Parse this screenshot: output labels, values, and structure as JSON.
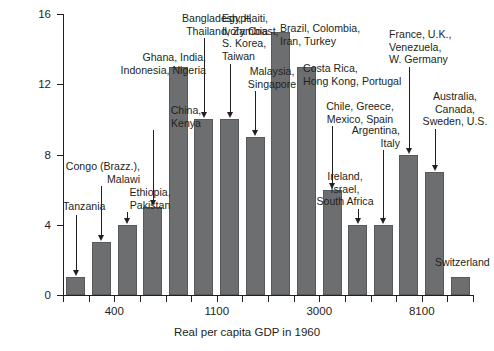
{
  "chart_data": {
    "type": "bar",
    "title": "",
    "subtitle": "",
    "xlabel": "Real per capita GDP in 1960",
    "ylabel": "Number of countries",
    "ylim": [
      0,
      16
    ],
    "yticks": [
      0,
      4,
      8,
      12,
      16
    ],
    "ytick_labels": [
      "0",
      "4",
      "8",
      "12",
      "16"
    ],
    "xtick_labels": [
      "400",
      "1100",
      "3000",
      "8100"
    ],
    "xtick_bins": [
      2,
      6,
      10,
      14
    ],
    "grid": false,
    "legend": "none",
    "bin_count": 16,
    "categories": [
      "1",
      "2",
      "3",
      "4",
      "5",
      "6",
      "7",
      "8",
      "9",
      "10",
      "11",
      "12",
      "13",
      "14",
      "15",
      "16"
    ],
    "values": [
      1,
      3,
      4,
      5,
      13,
      10,
      10,
      9,
      15,
      13,
      6,
      4,
      4,
      8,
      7,
      1
    ],
    "bar_color": "#6d6e70",
    "annotations": [
      {
        "text": "Tanzania",
        "bin": 1,
        "align": "center"
      },
      {
        "text": "Congo (Brazz.),\nMalawi",
        "bin": 2,
        "align": "right"
      },
      {
        "text": "Ethiopia,\nPakistan",
        "bin": 3,
        "align": "center"
      },
      {
        "text": "China,\nKenya",
        "bin": 4,
        "align": "center"
      },
      {
        "text": "Ghana, India,\nIndonesia, Nigeria",
        "bin": 5,
        "align": "right"
      },
      {
        "text": "Bangladesh, Haiti,\nThailand, Zambia",
        "bin": 6,
        "align": "right"
      },
      {
        "text": "Egypt,\nIvory Coast,\nS. Korea,\nTaiwan",
        "bin": 7,
        "align": "left"
      },
      {
        "text": "Malaysia,\nSingapore",
        "bin": 8,
        "align": "center"
      },
      {
        "text": "Brazil, Colombia,\nIran, Turkey",
        "bin": 9,
        "align": "left"
      },
      {
        "text": "Costa Rica,\nHong Kong, Portugal",
        "bin": 10,
        "align": "left"
      },
      {
        "text": "Chile, Greece,\nMexico, Spain",
        "bin": 11,
        "align": "center"
      },
      {
        "text": "Ireland,\nIsrael,\nSouth Africa",
        "bin": 12,
        "align": "center"
      },
      {
        "text": "Argentina,\nItaly",
        "bin": 13,
        "align": "right"
      },
      {
        "text": "France, U.K.,\nVenezuela,\nW. Germany",
        "bin": 14,
        "align": "left"
      },
      {
        "text": "Australia,\nCanada,\nSweden, U.S.",
        "bin": 15,
        "align": "center"
      },
      {
        "text": "Switzerland",
        "bin": 16,
        "align": "left"
      }
    ]
  }
}
